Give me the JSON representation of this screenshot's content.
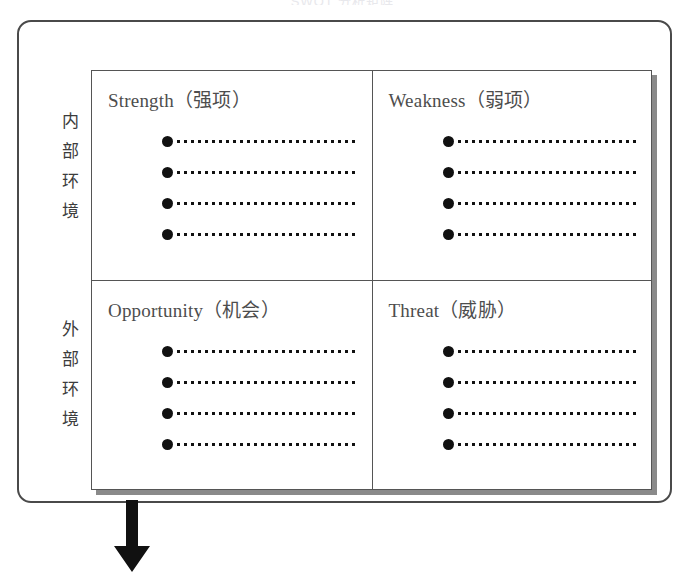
{
  "title_sliver": "SWOT 分析矩阵",
  "environment_labels": {
    "internal": "内部环境",
    "external": "外部环境"
  },
  "quadrants": [
    {
      "id": "strength",
      "title": "Strength（强项）",
      "bullet_count": 4
    },
    {
      "id": "weakness",
      "title": "Weakness（弱项）",
      "bullet_count": 4
    },
    {
      "id": "opportunity",
      "title": "Opportunity（机会）",
      "bullet_count": 4
    },
    {
      "id": "threat",
      "title": "Threat（威胁）",
      "bullet_count": 4
    }
  ],
  "arrow": {
    "direction": "down",
    "color": "#111111"
  },
  "colors": {
    "outline": "#4a4a4a",
    "matrix_border": "#555555",
    "shadow": "#8a8a8a",
    "heading_text": "#4d4d4d",
    "label_text": "#3c3c3c",
    "bullet": "#111111",
    "background": "#ffffff"
  }
}
